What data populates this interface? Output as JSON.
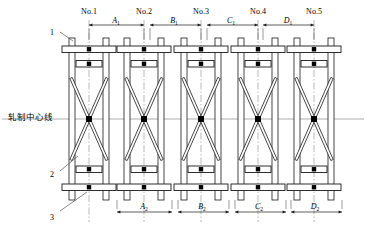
{
  "diagram": {
    "centerline_label": "轧制中心线",
    "stands": [
      {
        "id": "s1",
        "label": "No.1",
        "cx": 89
      },
      {
        "id": "s2",
        "label": "No.2",
        "cx": 144
      },
      {
        "id": "s3",
        "label": "No.3",
        "cx": 201
      },
      {
        "id": "s4",
        "label": "No.4",
        "cx": 258
      },
      {
        "id": "s5",
        "label": "No.5",
        "cx": 314
      }
    ],
    "top_dimensions": [
      {
        "id": "A1",
        "letter": "A",
        "sub": "1",
        "x1": 89,
        "x2": 144,
        "mid": 116
      },
      {
        "id": "B1",
        "letter": "B",
        "sub": "1",
        "x1": 150,
        "x2": 201,
        "mid": 174
      },
      {
        "id": "C1",
        "letter": "C",
        "sub": "1",
        "x1": 207,
        "x2": 258,
        "mid": 231
      },
      {
        "id": "D1",
        "letter": "D",
        "sub": "1",
        "x1": 263,
        "x2": 314,
        "mid": 288
      }
    ],
    "bottom_dimensions": [
      {
        "id": "A2",
        "letter": "A",
        "sub": "2",
        "x1": 117,
        "x2": 172,
        "mid": 144
      },
      {
        "id": "B2",
        "letter": "B",
        "sub": "2",
        "x1": 178,
        "x2": 229,
        "mid": 202
      },
      {
        "id": "C2",
        "letter": "C",
        "sub": "2",
        "x1": 235,
        "x2": 286,
        "mid": 259
      },
      {
        "id": "D2",
        "letter": "D",
        "sub": "2",
        "x1": 291,
        "x2": 342,
        "mid": 315
      }
    ],
    "callouts": [
      {
        "id": "c1",
        "label": "1",
        "tx": 52,
        "ty": 29,
        "lx1": 60,
        "ly1": 32,
        "lx2": 73,
        "ly2": 41
      },
      {
        "id": "c2",
        "label": "2",
        "tx": 52,
        "ty": 171,
        "lx1": 60,
        "ly1": 171,
        "lx2": 78,
        "ly2": 156
      },
      {
        "id": "c3",
        "label": "3",
        "tx": 52,
        "ty": 214,
        "lx1": 60,
        "ly1": 211,
        "lx2": 87,
        "ly2": 192
      }
    ],
    "geometry": {
      "frame_top": 38,
      "frame_bottom": 200,
      "centerline_y": 119,
      "post_width": 6,
      "roll_color": "#ffffff",
      "line_color": "#1a1a1a",
      "centerline_color": "#8a8a8a"
    }
  }
}
